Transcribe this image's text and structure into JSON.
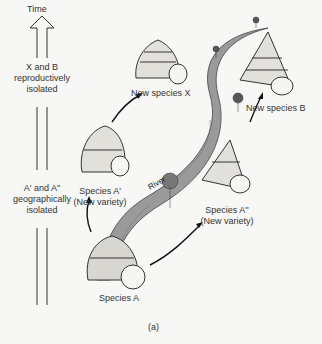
{
  "timeline": {
    "title": "Time",
    "top_note": [
      "X and B",
      "reproductively",
      "isolated"
    ],
    "bottom_note": [
      "A' and A''",
      "geographically",
      "isolated"
    ]
  },
  "labels": {
    "new_species_x": "New species X",
    "new_species_b": "New species B",
    "species_a_prime": "Species A'",
    "species_a_prime_sub": "(New variety)",
    "species_a_dprime": "Species A''",
    "species_a_dprime_sub": "(New variety)",
    "species_a": "Species A",
    "river": "River"
  },
  "caption": "(a)",
  "colors": {
    "river": "#9a9a9a",
    "outline": "#2a2a2a",
    "background": "#f7f7f5"
  }
}
